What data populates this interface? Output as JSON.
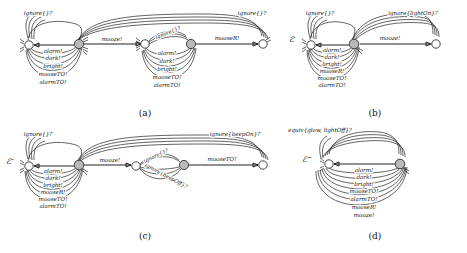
{
  "figure": {
    "title": "",
    "panels": [
      {
        "id": "a",
        "caption": "(a)",
        "nodes": [
          {
            "id": "a0",
            "style": "open"
          },
          {
            "id": "a1",
            "style": "filled"
          },
          {
            "id": "a2",
            "style": "open"
          },
          {
            "id": "a3",
            "style": "filled"
          },
          {
            "id": "a4",
            "style": "open"
          }
        ],
        "labels": {
          "top_left": "ignore{}?",
          "top_right": "ignore{}?",
          "mid_left": "mooze!",
          "mid_right": "mooseR!",
          "diagonal": "ignore{}?",
          "loop_left": [
            "alarm!",
            "dark!",
            "bright!",
            "mooseTO!",
            "alarmTO!"
          ],
          "loop_right": [
            "alarm!",
            "dark!",
            "bright!",
            "mooseTO!",
            "alarmTO!"
          ]
        }
      },
      {
        "id": "b",
        "caption": "(b)",
        "nodes": [
          {
            "id": "b0",
            "style": "open"
          },
          {
            "id": "b1",
            "style": "filled"
          },
          {
            "id": "b2",
            "style": "open"
          }
        ],
        "labels": {
          "state_name": "ℰ′",
          "top_left": "ignore{}?",
          "top_right": "ignore{lightOn}?",
          "mid_right": "mooze!",
          "loop_left": [
            "alarm!",
            "dark!",
            "bright!",
            "mooseR!",
            "mooseTO!",
            "alarmTO!"
          ]
        }
      },
      {
        "id": "c",
        "caption": "(c)",
        "nodes": [
          {
            "id": "c0",
            "style": "open"
          },
          {
            "id": "c1",
            "style": "filled"
          },
          {
            "id": "c2",
            "style": "open"
          },
          {
            "id": "c3",
            "style": "filled"
          },
          {
            "id": "c4",
            "style": "open"
          }
        ],
        "labels": {
          "state_name": "ℰ″",
          "top_left": "ignore{}?",
          "top_right": "ignore{beepOn}?",
          "mid_left": "mooze!",
          "mid_right": "mooseTO!",
          "diagonal_upper": "ignore{}?",
          "diagonal_lower": "ignore{beepOff}?",
          "loop_left": [
            "alarm!",
            "dark!",
            "bright!",
            "mooseR!",
            "mooseTO!",
            "alarmTO!"
          ]
        }
      },
      {
        "id": "d",
        "caption": "(d)",
        "nodes": [
          {
            "id": "d0",
            "style": "open"
          },
          {
            "id": "d1",
            "style": "filled"
          }
        ],
        "labels": {
          "state_name": "ℰ‴",
          "top_left": "equiv{glow, lightOff}?",
          "loop_left": [
            "alarm!",
            "dark!",
            "bright!",
            "mooseTO!",
            "alarmTO!",
            "mooseR!",
            "mooze!"
          ]
        }
      }
    ]
  },
  "colors": {
    "stroke": "#303030",
    "node_fill": "#b9b9b9",
    "node_open": "#ffffff",
    "text": "#111111",
    "background": "#ffffff"
  }
}
